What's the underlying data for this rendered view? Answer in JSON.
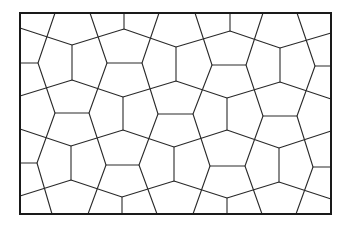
{
  "diagram": {
    "type": "cairo-pentagonal-tiling",
    "colors": {
      "line": "#2a2a2a",
      "frame": "#1a1a1a",
      "background": "#ffffff"
    },
    "frame": {
      "x": 20,
      "y": 13,
      "width": 311,
      "height": 201
    },
    "polylines": [
      [
        [
          20,
          28
        ],
        [
          72,
          45
        ],
        [
          124,
          29
        ],
        [
          176,
          47
        ],
        [
          230,
          31
        ],
        [
          280,
          48
        ],
        [
          331,
          33
        ]
      ],
      [
        [
          20,
          96
        ],
        [
          72,
          80
        ],
        [
          123,
          97
        ],
        [
          176,
          81
        ],
        [
          227,
          98
        ],
        [
          280,
          82
        ],
        [
          331,
          99
        ]
      ],
      [
        [
          20,
          129
        ],
        [
          71,
          146
        ],
        [
          123,
          130
        ],
        [
          174,
          147
        ],
        [
          227,
          130
        ],
        [
          279,
          148
        ],
        [
          331,
          131
        ]
      ],
      [
        [
          20,
          196
        ],
        [
          71,
          180
        ],
        [
          122,
          197
        ],
        [
          174,
          181
        ],
        [
          227,
          198
        ],
        [
          279,
          182
        ],
        [
          331,
          199
        ]
      ],
      [
        [
          55,
          13
        ],
        [
          38,
          63
        ],
        [
          55,
          113
        ],
        [
          37,
          163
        ],
        [
          52,
          214
        ]
      ],
      [
        [
          90,
          13
        ],
        [
          107,
          63
        ],
        [
          89,
          113
        ],
        [
          106,
          165
        ],
        [
          88,
          214
        ]
      ],
      [
        [
          159,
          13
        ],
        [
          142,
          63
        ],
        [
          158,
          114
        ],
        [
          139,
          165
        ],
        [
          157,
          214
        ]
      ],
      [
        [
          195,
          13
        ],
        [
          212,
          65
        ],
        [
          193,
          114
        ],
        [
          210,
          166
        ],
        [
          193,
          214
        ]
      ],
      [
        [
          263,
          13
        ],
        [
          246,
          65
        ],
        [
          263,
          116
        ],
        [
          245,
          166
        ],
        [
          262,
          214
        ]
      ],
      [
        [
          297,
          13
        ],
        [
          315,
          66
        ],
        [
          297,
          116
        ],
        [
          313,
          167
        ],
        [
          296,
          214
        ]
      ]
    ],
    "segments": [
      [
        124,
        13,
        124,
        29
      ],
      [
        230,
        13,
        230,
        31
      ],
      [
        72,
        45,
        72,
        80
      ],
      [
        176,
        47,
        176,
        81
      ],
      [
        280,
        48,
        280,
        82
      ],
      [
        123,
        97,
        123,
        130
      ],
      [
        227,
        98,
        227,
        130
      ],
      [
        71,
        146,
        71,
        180
      ],
      [
        174,
        147,
        174,
        181
      ],
      [
        279,
        148,
        279,
        182
      ],
      [
        122,
        197,
        122,
        214
      ],
      [
        227,
        198,
        227,
        214
      ],
      [
        20,
        63,
        38,
        63
      ],
      [
        107,
        63,
        142,
        63
      ],
      [
        212,
        65,
        246,
        65
      ],
      [
        315,
        66,
        331,
        66
      ],
      [
        55,
        113,
        89,
        113
      ],
      [
        158,
        114,
        193,
        114
      ],
      [
        263,
        116,
        297,
        116
      ],
      [
        20,
        163,
        37,
        163
      ],
      [
        106,
        165,
        139,
        165
      ],
      [
        210,
        166,
        245,
        166
      ],
      [
        313,
        167,
        331,
        167
      ]
    ]
  }
}
